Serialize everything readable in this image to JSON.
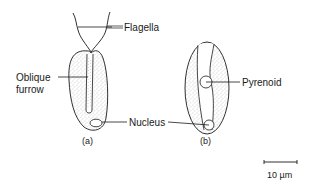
{
  "diagram": {
    "labels": {
      "flagella": "Flagella",
      "oblique_furrow_line1": "Oblique",
      "oblique_furrow_line2": "furrow",
      "pyrenoid": "Pyrenoid",
      "nucleus": "Nucleus"
    },
    "captions": {
      "a": "(a)",
      "b": "(b)"
    },
    "scale_bar": {
      "label": "10 µm"
    },
    "colors": {
      "line": "#1a1a1a",
      "stipple": "#8a8a8a",
      "background": "#ffffff"
    }
  }
}
